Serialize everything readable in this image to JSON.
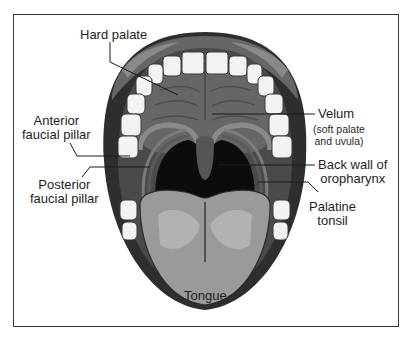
{
  "diagram": {
    "labels": {
      "hard_palate": "Hard palate",
      "anterior_faucial_pillar_1": "Anterior",
      "anterior_faucial_pillar_2": "faucial pillar",
      "posterior_faucial_pillar_1": "Posterior",
      "posterior_faucial_pillar_2": "faucial pillar",
      "velum": "Velum",
      "velum_sub_1": "(soft palate",
      "velum_sub_2": "and uvula)",
      "back_wall_1": "Back wall of",
      "back_wall_2": "oropharynx",
      "palatine_tonsil_1": "Palatine",
      "palatine_tonsil_2": "tonsil",
      "tongue": "Tongue"
    },
    "colors": {
      "lips": "#3c3c3c",
      "lip_highlight": "#8a8a8a",
      "teeth": "#f2f2f2",
      "palate": "#6a6a6a",
      "throat": "#0a0a0a",
      "tongue": "#9a9a9a",
      "tongue_light": "#b8b8b8",
      "frame": "#3a3a3a",
      "leader_line": "#1a1a1a"
    }
  }
}
